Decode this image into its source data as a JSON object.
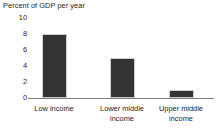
{
  "chart_data": {
    "type": "bar",
    "title": "Percent of GDP per year",
    "xlabel": "",
    "ylabel": "",
    "categories": [
      "Low income",
      "Lower middle income",
      "Upper middle income"
    ],
    "category_lines": [
      [
        "Low income"
      ],
      [
        "Lower middle",
        "income"
      ],
      [
        "Upper middle",
        "income"
      ]
    ],
    "values": [
      8,
      5,
      1
    ],
    "yticks": [
      10,
      8,
      6,
      4,
      2,
      0
    ],
    "ylim": [
      0,
      10
    ],
    "grid": false,
    "legend": null,
    "bar_color": "#333333",
    "axis_color": "#7a7a7a",
    "background_color": "#ffffff"
  }
}
